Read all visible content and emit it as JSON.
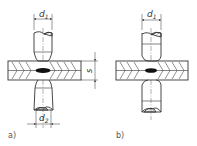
{
  "diagram": {
    "type": "technical-drawing",
    "colors": {
      "line": "#333333",
      "nugget": "#111111",
      "background": "#ffffff"
    },
    "panels": [
      {
        "id": "a",
        "caption": "a)",
        "top_electrode_label": "d",
        "top_electrode_sub": "1",
        "bottom_electrode_label": "d",
        "bottom_electrode_sub": "2",
        "thickness_label": "s"
      },
      {
        "id": "b",
        "caption": "b)",
        "top_electrode_label": "d",
        "top_electrode_sub": "1"
      }
    ]
  }
}
